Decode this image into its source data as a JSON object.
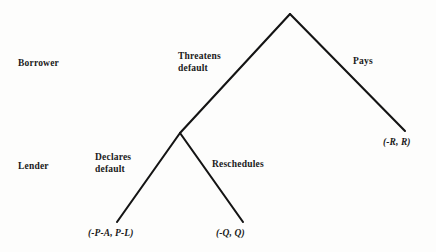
{
  "figure": {
    "type": "game-tree",
    "background_color": "#fdfdfc",
    "stroke_color": "#141414"
  },
  "player_labels": [
    {
      "name": "borrower",
      "text": "Borrower",
      "x": 18,
      "y": 58
    },
    {
      "name": "lender",
      "text": "Lender",
      "x": 18,
      "y": 161
    }
  ],
  "nodes": [
    {
      "id": "root",
      "player": "Borrower",
      "x": 290,
      "y": 14
    },
    {
      "id": "lender_node",
      "player": "Lender",
      "x": 180,
      "y": 133
    },
    {
      "id": "terminal_default",
      "x": 117,
      "y": 222
    },
    {
      "id": "terminal_reschedule",
      "x": 243,
      "y": 222
    },
    {
      "id": "terminal_pays",
      "x": 405,
      "y": 131
    }
  ],
  "edges": [
    {
      "name": "threatens-default",
      "from": "root",
      "to": "lender_node",
      "label": "Threatens\ndefault",
      "label_x": 178,
      "label_y": 51
    },
    {
      "name": "pays",
      "from": "root",
      "to": "terminal_pays",
      "label": "Pays",
      "label_x": 353,
      "label_y": 56
    },
    {
      "name": "declares-default",
      "from": "lender_node",
      "to": "terminal_default",
      "label": "Declares\ndefault",
      "label_x": 95,
      "label_y": 152
    },
    {
      "name": "reschedules",
      "from": "lender_node",
      "to": "terminal_reschedule",
      "label": "Reschedules",
      "label_x": 212,
      "label_y": 159
    }
  ],
  "payoffs": [
    {
      "name": "payoff-declares-default",
      "text": "(-P-A, P-L)",
      "x": 88,
      "y": 228
    },
    {
      "name": "payoff-reschedules",
      "text": "(-Q, Q)",
      "x": 216,
      "y": 228
    },
    {
      "name": "payoff-pays",
      "text": "(-R, R)",
      "x": 383,
      "y": 137
    }
  ]
}
